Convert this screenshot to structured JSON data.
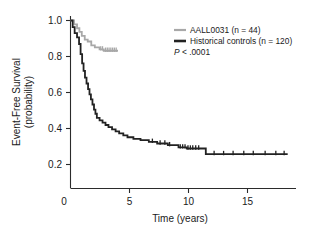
{
  "chart_data": {
    "type": "line",
    "title": "",
    "subtitle": "",
    "xlabel": "Time (years)",
    "ylabel_line1": "Event-Free Survival",
    "ylabel_line2": "(probability)",
    "xlim": [
      0,
      19
    ],
    "ylim": [
      0,
      1.05
    ],
    "xticks": [
      0,
      5,
      10,
      15
    ],
    "xtick_labels": [
      "0",
      "5",
      "10",
      "15"
    ],
    "yticks": [
      0.2,
      0.4,
      0.6,
      0.8,
      1.0
    ],
    "ytick_labels": [
      "0.2",
      "0.4",
      "0.6",
      "0.8",
      "1.0"
    ],
    "grid": false,
    "legend_position": "upper-right",
    "annotations": [
      {
        "text": "P < .0001",
        "p_symbol": "P",
        "p_rest": " < .0001"
      }
    ],
    "series": [
      {
        "name": "AALL0031 (n = 44)",
        "label_base": "AALL0031",
        "n": 44,
        "color": "#a8a8a8",
        "style": "step",
        "points": [
          [
            0.0,
            1.0
          ],
          [
            0.3,
            1.0
          ],
          [
            0.3,
            0.977
          ],
          [
            0.55,
            0.977
          ],
          [
            0.55,
            0.954
          ],
          [
            0.75,
            0.954
          ],
          [
            0.75,
            0.932
          ],
          [
            0.95,
            0.932
          ],
          [
            0.95,
            0.909
          ],
          [
            1.2,
            0.909
          ],
          [
            1.2,
            0.886
          ],
          [
            1.45,
            0.886
          ],
          [
            1.45,
            0.875
          ],
          [
            1.75,
            0.875
          ],
          [
            1.75,
            0.852
          ],
          [
            2.05,
            0.852
          ],
          [
            2.05,
            0.84
          ],
          [
            2.45,
            0.84
          ],
          [
            2.45,
            0.828
          ],
          [
            2.8,
            0.828
          ],
          [
            2.8,
            0.82
          ],
          [
            4.0,
            0.82
          ]
        ],
        "censor_marks": [
          [
            2.55,
            0.828
          ],
          [
            2.7,
            0.828
          ],
          [
            2.95,
            0.82
          ],
          [
            3.1,
            0.82
          ],
          [
            3.25,
            0.82
          ],
          [
            3.4,
            0.82
          ],
          [
            3.55,
            0.82
          ],
          [
            3.7,
            0.82
          ],
          [
            3.85,
            0.82
          ]
        ]
      },
      {
        "name": "Historical controls (n = 120)",
        "label_base": "Historical controls",
        "n": 120,
        "color": "#222222",
        "style": "step",
        "points": [
          [
            0.0,
            1.0
          ],
          [
            0.18,
            1.0
          ],
          [
            0.18,
            0.96
          ],
          [
            0.35,
            0.96
          ],
          [
            0.35,
            0.925
          ],
          [
            0.55,
            0.925
          ],
          [
            0.55,
            0.9
          ],
          [
            0.72,
            0.9
          ],
          [
            0.72,
            0.86
          ],
          [
            0.85,
            0.86
          ],
          [
            0.85,
            0.8
          ],
          [
            0.98,
            0.8
          ],
          [
            0.98,
            0.745
          ],
          [
            1.1,
            0.745
          ],
          [
            1.1,
            0.7
          ],
          [
            1.22,
            0.7
          ],
          [
            1.22,
            0.66
          ],
          [
            1.35,
            0.66
          ],
          [
            1.35,
            0.625
          ],
          [
            1.48,
            0.625
          ],
          [
            1.48,
            0.592
          ],
          [
            1.6,
            0.592
          ],
          [
            1.6,
            0.56
          ],
          [
            1.72,
            0.56
          ],
          [
            1.72,
            0.53
          ],
          [
            1.85,
            0.53
          ],
          [
            1.85,
            0.5
          ],
          [
            1.98,
            0.5
          ],
          [
            1.98,
            0.47
          ],
          [
            2.1,
            0.47
          ],
          [
            2.1,
            0.445
          ],
          [
            2.22,
            0.445
          ],
          [
            2.22,
            0.42
          ],
          [
            2.45,
            0.42
          ],
          [
            2.45,
            0.405
          ],
          [
            2.7,
            0.405
          ],
          [
            2.7,
            0.392
          ],
          [
            2.95,
            0.392
          ],
          [
            2.95,
            0.378
          ],
          [
            3.2,
            0.378
          ],
          [
            3.2,
            0.365
          ],
          [
            3.5,
            0.365
          ],
          [
            3.5,
            0.352
          ],
          [
            3.8,
            0.352
          ],
          [
            3.8,
            0.34
          ],
          [
            4.1,
            0.34
          ],
          [
            4.1,
            0.328
          ],
          [
            4.45,
            0.328
          ],
          [
            4.45,
            0.316
          ],
          [
            4.8,
            0.316
          ],
          [
            4.8,
            0.305
          ],
          [
            5.3,
            0.305
          ],
          [
            5.3,
            0.295
          ],
          [
            5.9,
            0.295
          ],
          [
            5.9,
            0.288
          ],
          [
            6.6,
            0.288
          ],
          [
            6.6,
            0.278
          ],
          [
            7.3,
            0.278
          ],
          [
            7.3,
            0.268
          ],
          [
            8.2,
            0.268
          ],
          [
            8.2,
            0.258
          ],
          [
            9.1,
            0.258
          ],
          [
            9.1,
            0.245
          ],
          [
            9.8,
            0.245
          ],
          [
            9.8,
            0.238
          ],
          [
            11.4,
            0.238
          ],
          [
            11.4,
            0.205
          ],
          [
            18.3,
            0.205
          ]
        ],
        "censor_marks": [
          [
            6.9,
            0.278
          ],
          [
            7.55,
            0.268
          ],
          [
            7.95,
            0.268
          ],
          [
            8.35,
            0.258
          ],
          [
            9.25,
            0.245
          ],
          [
            9.45,
            0.245
          ],
          [
            9.65,
            0.245
          ],
          [
            9.9,
            0.238
          ],
          [
            10.1,
            0.238
          ],
          [
            10.3,
            0.238
          ],
          [
            10.55,
            0.238
          ],
          [
            10.8,
            0.238
          ],
          [
            12.1,
            0.205
          ],
          [
            12.9,
            0.205
          ],
          [
            13.7,
            0.205
          ],
          [
            14.6,
            0.205
          ],
          [
            15.4,
            0.205
          ],
          [
            16.4,
            0.205
          ],
          [
            17.3,
            0.205
          ],
          [
            18.0,
            0.205
          ]
        ]
      }
    ]
  },
  "legend": {
    "entries": [
      {
        "label": "AALL0031 (n = 44)",
        "color": "#a8a8a8"
      },
      {
        "label": "Historical controls (n = 120)",
        "color": "#222222"
      }
    ],
    "pvalue_symbol": "P",
    "pvalue_rest": " < .0001"
  },
  "axes": {
    "x_title": "Time (years)",
    "y_title_line1": "Event-Free Survival",
    "y_title_line2": "(probability)"
  }
}
